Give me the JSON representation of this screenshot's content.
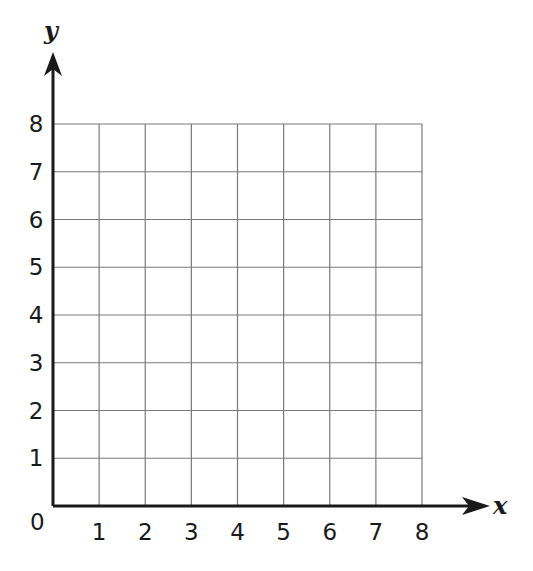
{
  "chart_data": {
    "type": "scatter",
    "title": "",
    "xlabel": "x",
    "ylabel": "y",
    "xlim": [
      0,
      8
    ],
    "ylim": [
      0,
      8
    ],
    "grid": true,
    "x_ticks": [
      "1",
      "2",
      "3",
      "4",
      "5",
      "6",
      "7",
      "8"
    ],
    "y_ticks": [
      "1",
      "2",
      "3",
      "4",
      "5",
      "6",
      "7",
      "8"
    ],
    "origin_label": "0",
    "series": []
  },
  "colors": {
    "axis": "#1a1a1a",
    "grid": "#7a7a7a"
  }
}
